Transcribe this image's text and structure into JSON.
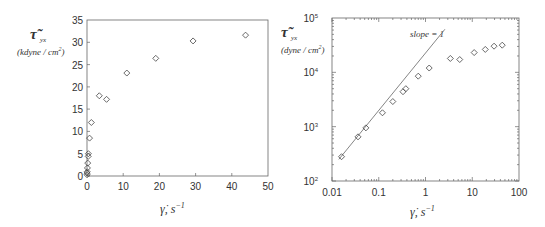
{
  "chart_data": [
    {
      "type": "scatter",
      "title": "",
      "xlabel": "γ̇, s⁻¹",
      "ylabel": "τ̃_yx (kdyne/cm²)",
      "xscale": "linear",
      "yscale": "linear",
      "xlim": [
        0,
        50
      ],
      "ylim": [
        0,
        35
      ],
      "xticks": [
        0,
        10,
        20,
        30,
        40,
        50
      ],
      "yticks": [
        0,
        5,
        10,
        15,
        20,
        25,
        30,
        35
      ],
      "grid": false,
      "marker": "open-diamond",
      "series": [
        {
          "name": "shear stress",
          "x": [
            0.016,
            0.036,
            0.053,
            0.12,
            0.2,
            0.33,
            0.38,
            0.7,
            1.2,
            3.4,
            5.4,
            11,
            19,
            29.3,
            43.8
          ],
          "y": [
            0.28,
            0.65,
            0.95,
            1.8,
            2.9,
            4.4,
            5.0,
            8.5,
            12.0,
            18.0,
            17.2,
            23.1,
            26.4,
            30.3,
            31.6
          ]
        }
      ]
    },
    {
      "type": "scatter",
      "title": "",
      "xlabel": "γ̇, s⁻¹",
      "ylabel": "τ̃_yx (dyne/cm²)",
      "xscale": "log",
      "yscale": "log",
      "xlim": [
        0.01,
        100
      ],
      "ylim": [
        100,
        100000
      ],
      "xticks": [
        0.01,
        0.1,
        1,
        10,
        100
      ],
      "yticks": [
        100,
        1000,
        10000,
        100000
      ],
      "grid": false,
      "marker": "open-diamond",
      "annotations": [
        "slope = 1"
      ],
      "series": [
        {
          "name": "shear stress",
          "x": [
            0.016,
            0.036,
            0.053,
            0.12,
            0.2,
            0.33,
            0.38,
            0.7,
            1.2,
            3.4,
            5.4,
            11,
            19,
            29.3,
            43.8
          ],
          "y": [
            280,
            650,
            950,
            1800,
            2900,
            4400,
            5000,
            8500,
            12000,
            18000,
            17200,
            23100,
            26400,
            30300,
            31600
          ]
        },
        {
          "name": "slope = 1 line",
          "type": "line",
          "x": [
            0.014,
            2.6
          ],
          "y": [
            250,
            62000
          ]
        }
      ]
    }
  ],
  "left_plot": {
    "ylabel_symbol": "τ̃",
    "ylabel_sub": "yx",
    "ylabel_units": "(kdyne / cm",
    "ylabel_units_sup": "2",
    "ylabel_units_close": ")",
    "xlabel_main": "γ̇, s",
    "xlabel_sup": "−1",
    "xtick_labels": [
      "0",
      "10",
      "20",
      "30",
      "40",
      "50"
    ],
    "ytick_labels": [
      "0",
      "5",
      "10",
      "15",
      "20",
      "25",
      "30",
      "35"
    ]
  },
  "right_plot": {
    "ylabel_symbol": "τ̃",
    "ylabel_sub": "yx",
    "ylabel_units": "(dyne / cm",
    "ylabel_units_sup": "2",
    "ylabel_units_close": ")",
    "xlabel_main": "γ̇, s",
    "xlabel_sup": "−1",
    "xtick_labels": [
      "0.01",
      "0.1",
      "1",
      "10",
      "100"
    ],
    "ytick_bases": [
      "10",
      "10",
      "10",
      "10"
    ],
    "ytick_exps": [
      "2",
      "3",
      "4",
      "5"
    ],
    "annotation": "slope = 1"
  }
}
